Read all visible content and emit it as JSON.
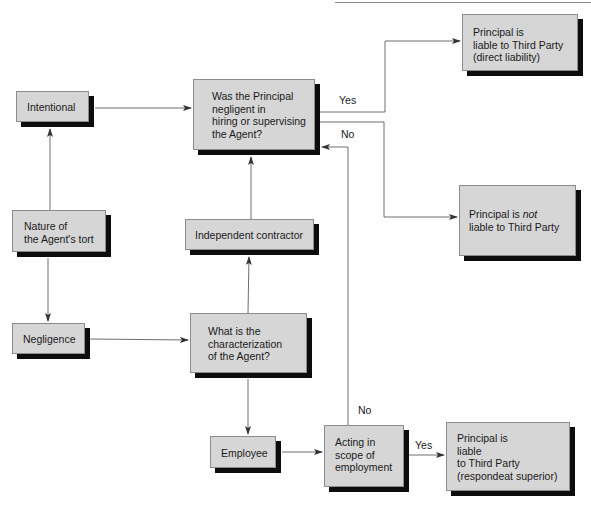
{
  "diagram": {
    "nodes": [
      {
        "id": "intentional",
        "label": "Intentional"
      },
      {
        "id": "negligent_question",
        "label": "Was the Principal\nnegligent in\nhiring or supervising\nthe Agent?"
      },
      {
        "id": "direct_liability",
        "label": "Principal is\nliable to Third Party\n(direct liability)"
      },
      {
        "id": "nature_tort",
        "label": "Nature of\nthe Agent's tort"
      },
      {
        "id": "independent_contractor",
        "label": "Independent contractor"
      },
      {
        "id": "not_liable_prefix",
        "label": "Principal is "
      },
      {
        "id": "not_liable_emph",
        "label": "not"
      },
      {
        "id": "not_liable_rest",
        "label": "liable to Third Party"
      },
      {
        "id": "negligence",
        "label": "Negligence"
      },
      {
        "id": "characterization",
        "label": "What is the\ncharacterization\nof the Agent?"
      },
      {
        "id": "employee",
        "label": "Employee"
      },
      {
        "id": "scope",
        "label": "Acting in\nscope of\nemployment"
      },
      {
        "id": "respondeat",
        "label": "Principal is\nliable\nto Third Party\n(respondeat superior)"
      }
    ],
    "edge_labels": {
      "yes_direct": "Yes",
      "no_to_question": "No",
      "no_scope": "No",
      "yes_scope": "Yes"
    },
    "edges": [
      {
        "from": "nature_tort",
        "to": "intentional"
      },
      {
        "from": "nature_tort",
        "to": "negligence"
      },
      {
        "from": "intentional",
        "to": "negligent_question"
      },
      {
        "from": "negligence",
        "to": "characterization"
      },
      {
        "from": "characterization",
        "to": "independent_contractor"
      },
      {
        "from": "characterization",
        "to": "employee"
      },
      {
        "from": "independent_contractor",
        "to": "negligent_question"
      },
      {
        "from": "employee",
        "to": "scope"
      },
      {
        "from": "scope",
        "to": "respondeat",
        "label": "Yes"
      },
      {
        "from": "scope",
        "to": "negligent_question",
        "label": "No"
      },
      {
        "from": "negligent_question",
        "to": "direct_liability",
        "label": "Yes"
      },
      {
        "from": "negligent_question",
        "to": "not_liable",
        "label": "No"
      }
    ],
    "colors": {
      "box_fill": "#d6d6d6",
      "shadow": "#0d0d0d",
      "line": "#6e6e6e"
    }
  }
}
